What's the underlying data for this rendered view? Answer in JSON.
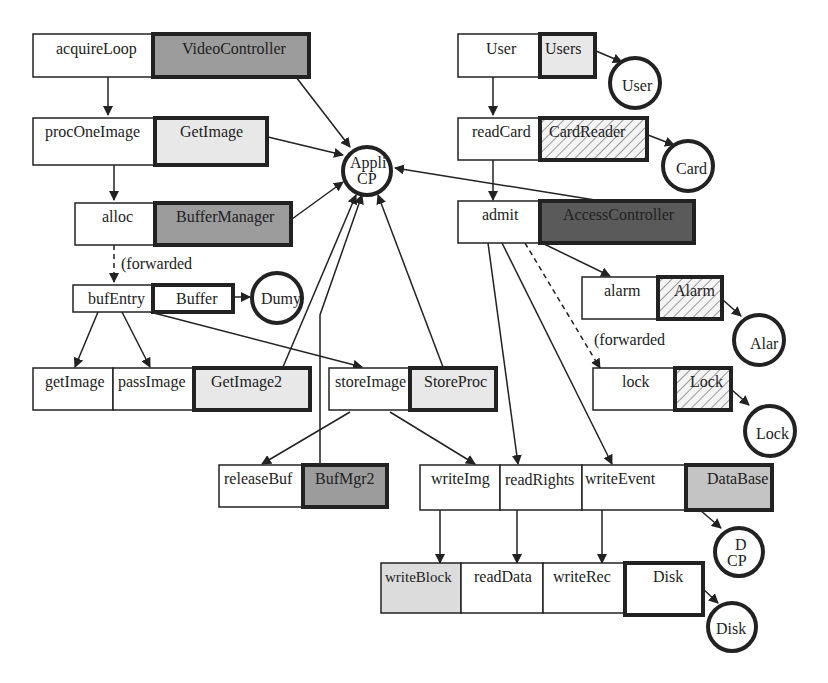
{
  "diagram": {
    "colors": {
      "dark": "#5a5a5a",
      "medium": "#9c9c9c",
      "light": "#dcdcdc",
      "white": "#ffffff",
      "stroke": "#222222"
    },
    "tasks": {
      "video_controller": {
        "entries": [
          "acquireLoop"
        ],
        "task": "VideoController"
      },
      "get_image": {
        "entries": [
          "procOneImage"
        ],
        "task": "GetImage"
      },
      "buffer_manager": {
        "entries": [
          "alloc"
        ],
        "task": "BufferManager"
      },
      "buffer": {
        "entries": [
          "bufEntry"
        ],
        "task": "Buffer"
      },
      "get_image2": {
        "entries": [
          "getImage",
          "passImage"
        ],
        "task": "GetImage2"
      },
      "store_proc": {
        "entries": [
          "storeImage"
        ],
        "task": "StoreProc"
      },
      "buf_mgr2": {
        "entries": [
          "releaseBuf"
        ],
        "task": "BufMgr2"
      },
      "users": {
        "entries": [
          "User"
        ],
        "task": "Users"
      },
      "card_reader": {
        "entries": [
          "readCard"
        ],
        "task": "CardReader"
      },
      "access_controller": {
        "entries": [
          "admit"
        ],
        "task": "AccessController"
      },
      "alarm": {
        "entries": [
          "alarm"
        ],
        "task": "Alarm"
      },
      "lock": {
        "entries": [
          "lock"
        ],
        "task": "Lock"
      },
      "database": {
        "entries": [
          "writeImg",
          "readRights",
          "writeEvent"
        ],
        "task": "DataBase"
      },
      "disk": {
        "entries": [
          "writeBlock",
          "readData",
          "writeRec"
        ],
        "task": "Disk"
      }
    },
    "processors": {
      "appli": [
        "Appli",
        "CP"
      ],
      "dumy": "Dumy",
      "user": "User",
      "card": "Card",
      "alarm": "Alar",
      "lock": "Lock",
      "db": [
        "D",
        "CP"
      ],
      "disk": "Disk"
    },
    "annotations": {
      "forwarded_left": "(forwarded",
      "forwarded_right": "(forwarded"
    }
  }
}
